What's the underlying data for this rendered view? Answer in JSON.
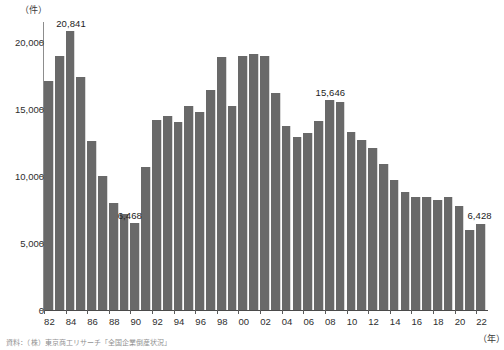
{
  "axes": {
    "y_unit": "（件）",
    "x_unit": "（年）",
    "y_ticks": [
      "0",
      "5,000",
      "10,000",
      "15,000",
      "20,000"
    ],
    "y_tick_values": [
      0,
      5000,
      10000,
      15000,
      20000
    ],
    "x_ticks": [
      "82",
      "84",
      "86",
      "88",
      "90",
      "92",
      "94",
      "96",
      "98",
      "00",
      "02",
      "04",
      "06",
      "08",
      "10",
      "12",
      "14",
      "16",
      "18",
      "20",
      "22"
    ]
  },
  "annotations": [
    {
      "year": "84",
      "text": "20,841"
    },
    {
      "year": "90",
      "text": "6,468"
    },
    {
      "year": "08",
      "text": "15,646"
    },
    {
      "year": "22",
      "text": "6,428"
    }
  ],
  "source_note": "資料：（株）東京商工リサーチ「全国企業倒産状況」",
  "style": {
    "bar_color": "#696969",
    "axis_color": "#5a5a5a",
    "text_color": "#231f20"
  },
  "chart_data": {
    "type": "bar",
    "title": "",
    "xlabel": "（年）",
    "ylabel": "（件）",
    "ylim": [
      0,
      21500
    ],
    "grid": false,
    "legend": "none",
    "categories": [
      "82",
      "83",
      "84",
      "85",
      "86",
      "87",
      "88",
      "89",
      "90",
      "91",
      "92",
      "93",
      "94",
      "95",
      "96",
      "97",
      "98",
      "99",
      "00",
      "01",
      "02",
      "03",
      "04",
      "05",
      "06",
      "07",
      "08",
      "09",
      "10",
      "11",
      "12",
      "13",
      "14",
      "15",
      "16",
      "17",
      "18",
      "19",
      "20",
      "21",
      "22"
    ],
    "values": [
      17100,
      19000,
      20841,
      17400,
      12600,
      10000,
      8000,
      7200,
      6468,
      10700,
      14200,
      14500,
      14000,
      15200,
      14800,
      16400,
      18900,
      15200,
      19000,
      19100,
      19000,
      16200,
      13700,
      12900,
      13200,
      14100,
      15646,
      15500,
      13300,
      12700,
      12100,
      10900,
      9700,
      8800,
      8400,
      8400,
      8200,
      8400,
      7800,
      6000,
      6428
    ]
  }
}
